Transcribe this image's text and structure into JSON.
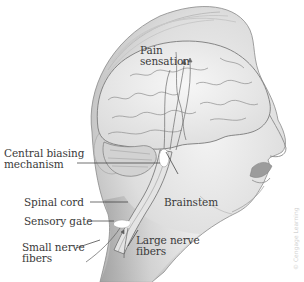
{
  "diagram": {
    "colors": {
      "background": "#ffffff",
      "skin_shade": "#d9d9d9",
      "brain": "#ececec",
      "outline": "#6e6e6e",
      "label_text": "#3a3a3a",
      "leader_line": "#333333",
      "gate_highlight": "#ffffff",
      "copyright_text": "#d2d2d2"
    },
    "labels": {
      "pain_sensation_line1": "Pain",
      "pain_sensation_line2": "sensation",
      "central_biasing_line1": "Central biasing",
      "central_biasing_line2": "mechanism",
      "spinal_cord": "Spinal cord",
      "sensory_gate": "Sensory gate",
      "small_nerve_line1": "Small nerve",
      "small_nerve_line2": "fibers",
      "large_nerve_line1": "Large nerve",
      "large_nerve_line2": "fibers",
      "brainstem": "Brainstem"
    },
    "copyright": "© Cengage Learning"
  }
}
